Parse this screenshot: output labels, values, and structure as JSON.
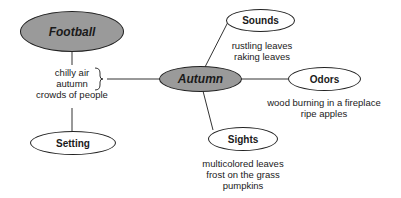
{
  "diagram": {
    "nodes": {
      "football": "Football",
      "autumn": "Autumn",
      "setting": "Setting",
      "sounds": "Sounds",
      "odors": "Odors",
      "sights": "Sights"
    },
    "details": {
      "setting": [
        "chilly air",
        "autumn",
        "crowds of people"
      ],
      "sounds": [
        "rustling leaves",
        "raking leaves"
      ],
      "odors": [
        "wood burning in a fireplace",
        "ripe apples"
      ],
      "sights": [
        "multicolored leaves",
        "frost on the grass",
        "pumpkins"
      ]
    },
    "colors": {
      "main_node_fill": "#9a9a9a",
      "sub_node_fill": "#ffffff",
      "stroke": "#222222"
    }
  }
}
